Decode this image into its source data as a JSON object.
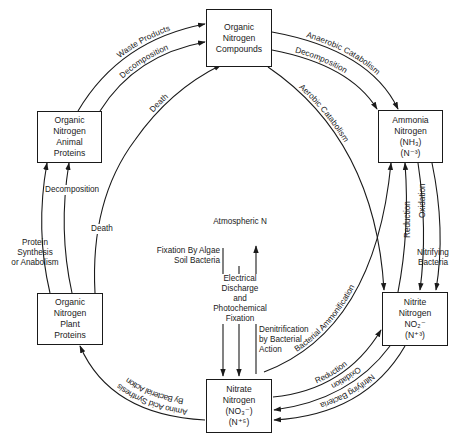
{
  "diagram": {
    "nodes": {
      "compounds": {
        "lines": [
          "Organic",
          "Nitrogen",
          "Compounds"
        ]
      },
      "animal": {
        "lines": [
          "Organic",
          "Nitrogen",
          "Animal",
          "Proteins"
        ]
      },
      "plant": {
        "lines": [
          "Organic",
          "Nitrogen",
          "Plant",
          "Proteins"
        ]
      },
      "ammonia": {
        "lines": [
          "Ammonia",
          "Nitrogen",
          "(NH₃)",
          "(N⁻³)"
        ]
      },
      "nitrite": {
        "lines": [
          "Nitrite",
          "Nitrogen",
          "NO₂⁻",
          "(N⁺³)"
        ]
      },
      "nitrate": {
        "lines": [
          "Nitrate",
          "Nitrogen",
          "(NO₃⁻)",
          "(N⁺⁵)"
        ]
      }
    },
    "center": {
      "atmospheric": "Atmospheric N",
      "fixation_algae": [
        "Fixation By Algae",
        "Soil Bacteria"
      ],
      "electrical": [
        "Electrical",
        "Discharge",
        "and",
        "Photochemical",
        "Fixation"
      ],
      "denitrification": [
        "Denitrification",
        "by Bacterial",
        "Action"
      ]
    },
    "edges": {
      "waste_products": "Waste Products",
      "decomposition_top_left": "Decomposition",
      "death_upper": "Death",
      "death_lower": "Death",
      "decomposition_left": "Decomposition",
      "protein_synthesis": [
        "Protein",
        "Synthesis",
        "or Anabolism"
      ],
      "anaerobic_catabolism": "Anaerobic Catabolism",
      "decomposition_top_right": "Decomposition",
      "aerobic_catabolism": "Aerobic Catabolism",
      "reduction_right": "Reduction",
      "oxidation_right": "Oxidation",
      "nitrifying_right": [
        "Nitrifying",
        "Bacteria"
      ],
      "bacterial_ammonification": "Bacterial Ammonification",
      "reduction_bottom": "Reduction",
      "oxidation_bottom": "Oxidation",
      "nitrifying_bottom": "Nitrifying Bacteria",
      "amino_acid": "Amino Acid Synthesis",
      "amino_acid_2": "By Bacterial Action"
    },
    "colors": {
      "ink": "#1a1a1a",
      "background": "#ffffff"
    }
  }
}
